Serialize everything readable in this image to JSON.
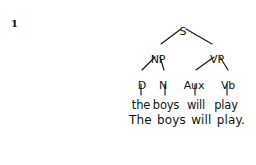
{
  "figure": {
    "number": "1",
    "type": "syntax-tree",
    "background_color": "#ffffff",
    "ink_color": "#141414"
  },
  "tree": {
    "nodes": [
      {
        "id": "S",
        "label": "S",
        "x": 183,
        "y": 26,
        "level": 0
      },
      {
        "id": "NP",
        "label": "NP",
        "x": 158,
        "y": 54,
        "level": 1
      },
      {
        "id": "VP",
        "label": "VP",
        "x": 217,
        "y": 54,
        "level": 1
      },
      {
        "id": "D",
        "label": "D",
        "x": 142,
        "y": 80,
        "level": 2
      },
      {
        "id": "N",
        "label": "N",
        "x": 163,
        "y": 80,
        "level": 2
      },
      {
        "id": "Aux",
        "label": "Aux",
        "x": 194,
        "y": 80,
        "level": 2
      },
      {
        "id": "Vb",
        "label": "Vb",
        "x": 228,
        "y": 80,
        "level": 2
      }
    ],
    "edges": [
      {
        "from": "S",
        "to": "NP",
        "x1": 181,
        "y1": 29,
        "x2": 161,
        "y2": 44
      },
      {
        "from": "S",
        "to": "VP",
        "x1": 186,
        "y1": 29,
        "x2": 212,
        "y2": 44
      },
      {
        "from": "NP",
        "to": "D",
        "x1": 155,
        "y1": 57,
        "x2": 142,
        "y2": 70
      },
      {
        "from": "NP",
        "to": "N",
        "x1": 160,
        "y1": 57,
        "x2": 164,
        "y2": 70
      },
      {
        "from": "VP",
        "to": "Aux",
        "x1": 214,
        "y1": 57,
        "x2": 196,
        "y2": 70
      },
      {
        "from": "VP",
        "to": "Vb",
        "x1": 220,
        "y1": 57,
        "x2": 228,
        "y2": 70
      },
      {
        "from": "D",
        "to": "the",
        "x1": 141,
        "y1": 84,
        "x2": 141,
        "y2": 95
      },
      {
        "from": "N",
        "to": "boys",
        "x1": 165,
        "y1": 84,
        "x2": 165,
        "y2": 95
      },
      {
        "from": "Aux",
        "to": "will",
        "x1": 195,
        "y1": 84,
        "x2": 195,
        "y2": 95
      },
      {
        "from": "Vb",
        "to": "play",
        "x1": 227,
        "y1": 84,
        "x2": 227,
        "y2": 95
      }
    ],
    "terminals": [
      {
        "id": "the",
        "label": "the",
        "x": 141,
        "y": 99
      },
      {
        "id": "boys",
        "label": "boys",
        "x": 166,
        "y": 99
      },
      {
        "id": "will",
        "label": "will",
        "x": 196,
        "y": 99
      },
      {
        "id": "play",
        "label": "play",
        "x": 226,
        "y": 99
      }
    ]
  },
  "sentence": {
    "text": "The boys will play."
  }
}
